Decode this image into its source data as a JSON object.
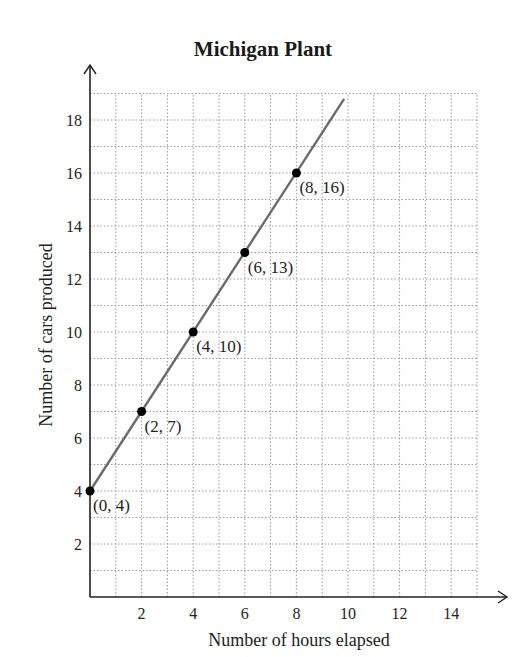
{
  "chart_data": {
    "type": "line",
    "title": "Michigan Plant",
    "xlabel": "Number of hours elapsed",
    "ylabel": "Number of cars produced",
    "xlim": [
      0,
      15
    ],
    "ylim": [
      0,
      19
    ],
    "x_ticks": [
      2,
      4,
      6,
      8,
      10,
      12,
      14
    ],
    "y_ticks": [
      2,
      4,
      6,
      8,
      10,
      12,
      14,
      16,
      18
    ],
    "grid": true,
    "grid_style": "dotted",
    "series": [
      {
        "name": "Michigan Plant",
        "points": [
          {
            "x": 0,
            "y": 4,
            "label": "(0, 4)"
          },
          {
            "x": 2,
            "y": 7,
            "label": "(2, 7)"
          },
          {
            "x": 4,
            "y": 10,
            "label": "(4, 10)"
          },
          {
            "x": 6,
            "y": 13,
            "label": "(6, 13)"
          },
          {
            "x": 8,
            "y": 16,
            "label": "(8, 16)"
          }
        ],
        "line_extends_to": {
          "x": 9.85,
          "y": 18.8
        },
        "color": "#6b6b6b"
      }
    ],
    "legend": "none"
  },
  "colors": {
    "axis": "#222222",
    "grid": "#9a9a9a",
    "line": "#6b6b6b",
    "point": "#000000"
  }
}
